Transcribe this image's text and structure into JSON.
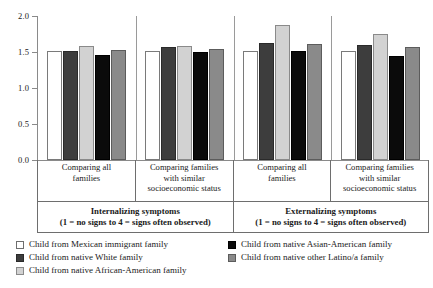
{
  "chart_data": {
    "type": "bar",
    "title": "",
    "xlabel": "",
    "ylabel": "",
    "ylim": [
      0,
      2.0
    ],
    "ytick_labels": [
      "2.0",
      "1.5",
      "1.0",
      "0.5",
      "0.0"
    ],
    "ytick_values": [
      2.0,
      1.5,
      1.0,
      0.5,
      0.0
    ],
    "grid": false,
    "legend_position": "bottom",
    "categories": [
      "Comparing all families",
      "Comparing families with similar socioeconomic status",
      "Comparing all families",
      "Comparing families with similar socioeconomic status"
    ],
    "series": [
      {
        "name": "Child from Mexican immigrant family",
        "color": "#ffffff",
        "values": [
          1.51,
          1.51,
          1.51,
          1.51
        ]
      },
      {
        "name": "Child from native White family",
        "color": "#3d3d3d",
        "values": [
          1.51,
          1.57,
          1.62,
          1.6
        ]
      },
      {
        "name": "Child from native African-American family",
        "color": "#d2d2d2",
        "values": [
          1.59,
          1.59,
          1.87,
          1.75
        ]
      },
      {
        "name": "Child from native Asian-American family",
        "color": "#0b0b0b",
        "values": [
          1.46,
          1.5,
          1.52,
          1.45
        ]
      },
      {
        "name": "Child from native other Latino/a family",
        "color": "#8a8a8a",
        "values": [
          1.53,
          1.54,
          1.61,
          1.57
        ]
      }
    ]
  },
  "axis": {
    "ticks": [
      {
        "label": "2.0"
      },
      {
        "label": "1.5"
      },
      {
        "label": "1.0"
      },
      {
        "label": "0.5"
      },
      {
        "label": "0.0"
      }
    ]
  },
  "category_cells": [
    {
      "line1": "Comparing all",
      "line2": "families",
      "line3": ""
    },
    {
      "line1": "Comparing families",
      "line2": "with similar",
      "line3": "socioeconomic status"
    },
    {
      "line1": "Comparing all",
      "line2": "families",
      "line3": ""
    },
    {
      "line1": "Comparing families",
      "line2": "with similar",
      "line3": "socioeconomic status"
    }
  ],
  "super_groups": [
    {
      "title": "Internalizing symptoms",
      "subtitle": "(1 = no signs to 4 = signs often observed)"
    },
    {
      "title": "Externalizing symptoms",
      "subtitle": "(1 = no signs to 4 = signs often observed)"
    }
  ],
  "legend": {
    "left_column": [
      {
        "label": "Child from Mexican immigrant family",
        "swatch": "sw-white"
      },
      {
        "label": "Child from native White family",
        "swatch": "sw-darkgray"
      },
      {
        "label": "Child from native African-American family",
        "swatch": "sw-lightgray"
      }
    ],
    "right_column": [
      {
        "label": "Child from native Asian-American family",
        "swatch": "sw-black"
      },
      {
        "label": "Child from native other Latino/a family",
        "swatch": "sw-medgray"
      }
    ]
  }
}
